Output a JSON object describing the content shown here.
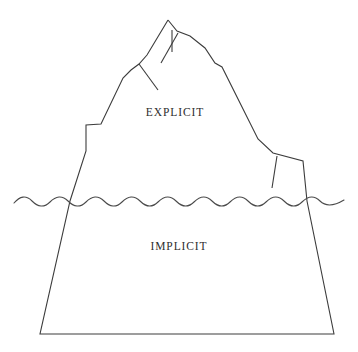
{
  "diagram": {
    "type": "iceberg-diagram",
    "background_color": "#ffffff",
    "line_color": "#3c3c3c",
    "water_line_color": "#4a4a4a",
    "labels": {
      "above_water": "EXPLICIT",
      "below_water": "IMPLICIT"
    },
    "regions": [
      {
        "name": "above-water-region",
        "label": "EXPLICIT",
        "position": "above the waterline",
        "label_x": 175,
        "label_y": 112
      },
      {
        "name": "below-water-region",
        "label": "IMPLICIT",
        "position": "below the waterline",
        "label_x": 179,
        "label_y": 247
      }
    ],
    "geometry": {
      "canvas_width": 358,
      "canvas_height": 352,
      "water_line_y": 201,
      "iceberg_peak": [
        168,
        20
      ],
      "base_left": [
        40,
        334
      ],
      "base_right": [
        334,
        334
      ],
      "left_waterline_crossing": [
        70,
        201
      ],
      "right_waterline_crossing": [
        307,
        201
      ],
      "outline_points": "168,20 153,44 139,64 131,69 123,77 100,125 86,126 86,150 70,201 40,334 334,334 307,201 302,160 272,153 222,67 215,63 190,37 177,31",
      "water_wave": {
        "amplitude": 5,
        "wavelength": 36,
        "start_x": 14,
        "end_x": 344
      }
    },
    "cracks": [
      {
        "name": "peak-vertical-crack",
        "points": "172,29 172,50"
      },
      {
        "name": "left-ridge-crack",
        "points": "139,64 157,88"
      },
      {
        "name": "secondary-ridge-crack",
        "points": "178,32 162,62"
      },
      {
        "name": "right-ledge-crack",
        "points": "277,155 272,187"
      }
    ]
  }
}
